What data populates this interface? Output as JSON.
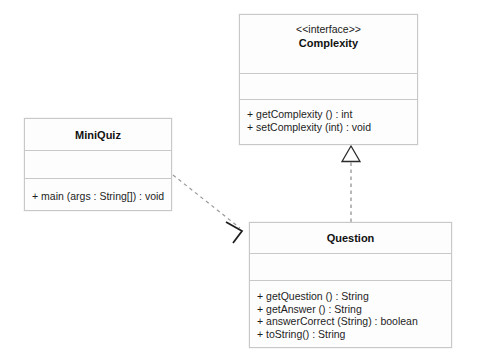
{
  "diagram": {
    "kind": "uml-class-diagram",
    "background_color": "#ffffff",
    "border_color": "#c8c8c8",
    "text_color": "#1d1d1d"
  },
  "classes": {
    "complexity": {
      "stereotype": "<<interface>>",
      "name": "Complexity",
      "attributes": [],
      "operations": [
        "+ getComplexity () : int",
        "+ setComplexity (int) : void"
      ]
    },
    "miniquiz": {
      "stereotype": "",
      "name": "MiniQuiz",
      "attributes": [],
      "operations": [
        "+ main (args : String[]) : void"
      ]
    },
    "question": {
      "stereotype": "",
      "name": "Question",
      "attributes": [],
      "operations": [
        "+ getQuestion () : String",
        "+ getAnswer () : String",
        "+ answerCorrect (String) : boolean",
        "+ toString() : String"
      ]
    }
  },
  "relationships": [
    {
      "id": "realization-question-complexity",
      "type": "realization",
      "label": "",
      "from": "Question",
      "to": "Complexity",
      "line_style": "dashed",
      "arrowhead": "hollow-triangle"
    },
    {
      "id": "dependency-miniquiz-question",
      "type": "dependency",
      "label": "",
      "from": "MiniQuiz",
      "to": "Question",
      "line_style": "dashed",
      "arrowhead": "open-arrow"
    }
  ]
}
